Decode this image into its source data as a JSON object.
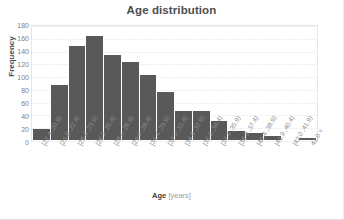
{
  "chart_data": {
    "type": "bar",
    "title": "Age distribution",
    "xlabel": "Age [years]",
    "xlabel_bold": "Age",
    "xlabel_unit": "[years]",
    "ylabel": "Frequency",
    "ylim": [
      0,
      180
    ],
    "ytick_step": 20,
    "yticks": [
      "180",
      "160",
      "140",
      "120",
      "100",
      "80",
      "60",
      "40",
      "20",
      "0"
    ],
    "grid": true,
    "legend": "none",
    "bar_color": "#595959",
    "categories": [
      "(20.9, 22.4]",
      "(22.4, 23.9]",
      "(23.9, 25.4]",
      "(25.4, 26.9]",
      "(26.9, 28.4]",
      "(28.4, 29.9]",
      "(29.9, 31.4]",
      "(31.4, 32.9]",
      "(32.9, 34.4]",
      "(34.4, 35.9]",
      "(35.9, 37.4]",
      "(37.4, 38.9]",
      "(38.9, 40.4]",
      "(40.4, 41.9]",
      "(41.9, 42.0]",
      "> 42.0"
    ],
    "values": [
      18,
      87,
      150,
      165,
      136,
      125,
      103,
      76,
      46,
      46,
      30,
      15,
      11,
      7,
      0,
      4
    ]
  }
}
